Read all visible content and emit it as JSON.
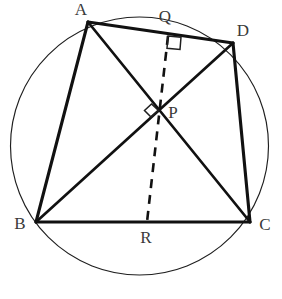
{
  "figure": {
    "kind": "cyclic-quadrilateral-diagram",
    "background_color": "#ffffff",
    "stroke_color": "#111111",
    "label_color": "#3a3a3a",
    "width": 282,
    "height": 299
  },
  "circle": {
    "name": "circumscribed-circle",
    "cx": 139.5,
    "cy": 146.0,
    "r": 129.0,
    "stroke": "#1f1f1f",
    "stroke_width": 1.15
  },
  "points": {
    "A": {
      "label": "A",
      "x": 88,
      "y": 22,
      "label_x": 81,
      "label_y": 15
    },
    "B": {
      "label": "B",
      "x": 36,
      "y": 222,
      "label_x": 20,
      "label_y": 229
    },
    "C": {
      "label": "C",
      "x": 250,
      "y": 222,
      "label_x": 265,
      "label_y": 230
    },
    "D": {
      "label": "D",
      "x": 233,
      "y": 43,
      "label_x": 243,
      "label_y": 36
    },
    "P": {
      "label": "P",
      "x": 159,
      "y": 110,
      "label_x": 173,
      "label_y": 118
    },
    "Q": {
      "label": "Q",
      "x": 168,
      "y": 36,
      "label_x": 165,
      "label_y": 22
    },
    "R": {
      "label": "R",
      "x": 147,
      "y": 222,
      "label_x": 146,
      "label_y": 243
    }
  },
  "edges": [
    {
      "name": "edge-AB",
      "from": "A",
      "to": "B",
      "style": "solid",
      "weight": "thick"
    },
    {
      "name": "edge-BC",
      "from": "B",
      "to": "C",
      "style": "solid",
      "weight": "thick"
    },
    {
      "name": "edge-CD",
      "from": "C",
      "to": "D",
      "style": "solid",
      "weight": "thick"
    },
    {
      "name": "edge-DA",
      "from": "D",
      "to": "A",
      "style": "solid",
      "weight": "thick"
    },
    {
      "name": "diagonal-AC",
      "from": "A",
      "to": "C",
      "style": "solid",
      "weight": "medium"
    },
    {
      "name": "diagonal-BD",
      "from": "B",
      "to": "D",
      "style": "solid",
      "weight": "medium"
    },
    {
      "name": "perpendicular-QR",
      "from": "Q",
      "to": "R",
      "style": "dashed",
      "weight": "medium"
    }
  ],
  "right_angles": [
    {
      "name": "right-angle-at-Q",
      "at": "Q",
      "shape": "square",
      "points": "168,36 181,37.2 180,49.5 167,48.3",
      "description": "square mark showing QR is perpendicular to AD at Q"
    },
    {
      "name": "right-angle-at-P",
      "at": "P",
      "shape": "diamond",
      "points": "151.5,104 158.5,110.5 151,117 144.5,110.5",
      "description": "diamond mark showing diagonals AC and BD meet at right angles at P"
    }
  ],
  "labels_order": [
    "A",
    "Q",
    "D",
    "P",
    "B",
    "R",
    "C"
  ]
}
